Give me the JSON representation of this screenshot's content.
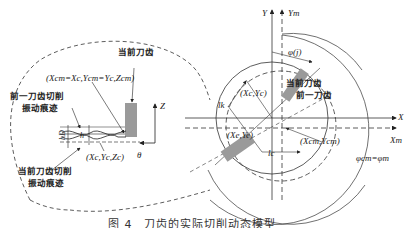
{
  "diagram": {
    "left_detail": {
      "current_tooth_label": "当前刀齿",
      "center_coords_label": "(Xcm=Xc,Ycm=Yc,Zcm)",
      "previous_tooth_trace_label_line1": "前一刀齿切削",
      "previous_tooth_trace_label_line2": "振动痕迹",
      "current_tooth_trace_label_line1": "当前刀齿切削",
      "current_tooth_trace_label_line2": "振动痕迹",
      "tip_coords_label": "(Xc,Yc,Zc)",
      "h_D_label": "hD",
      "h_label": "h",
      "z_axis_label": "Z",
      "theta_label": "θ"
    },
    "right_view": {
      "y_axis_label": "Y",
      "ym_axis_label": "Ym",
      "x_axis_label": "X",
      "xm_axis_label": "Xm",
      "phi_j_label": "φ(j)",
      "current_tooth_label": "当前刀齿",
      "previous_tooth_label": "前一刀齿",
      "center_c_label": "(Xc,Yc)",
      "tooth_coords_label": "(Xe,Ye)",
      "center_cm_label": "(Xcm,Ycm)",
      "lk_label": "lk",
      "lc_label": "lc",
      "phi_relation_label": "φcm=φm"
    },
    "caption": "图 4　刀齿的实际切削动态模型"
  }
}
